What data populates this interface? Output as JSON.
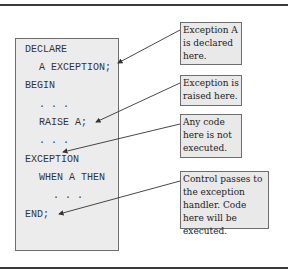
{
  "code_block": {
    "lines": [
      {
        "text": "DECLARE",
        "indent": 0
      },
      {
        "text": "A EXCEPTION;",
        "indent": 1
      },
      {
        "text": "BEGIN",
        "indent": 0
      },
      {
        "text": ". . .",
        "indent": 1
      },
      {
        "text": "RAISE A;",
        "indent": 1
      },
      {
        "text": ". . .",
        "indent": 1
      },
      {
        "text": "EXCEPTION",
        "indent": 0
      },
      {
        "text": "WHEN A THEN",
        "indent": 1
      },
      {
        "text": ". . .",
        "indent": 2
      },
      {
        "text": "END;",
        "indent": 0
      }
    ]
  },
  "callouts": [
    {
      "text": "Exception A is declared here.",
      "target_line": "A EXCEPTION;"
    },
    {
      "text": "Exception is raised here.",
      "target_line": "RAISE A;"
    },
    {
      "text": "Any code here is not executed.",
      "target_line": ". . ."
    },
    {
      "text": "Control passes to the exception handler.  Code here will be executed.",
      "target_line": "END;"
    }
  ],
  "colors": {
    "box_fill": "#ececec",
    "callout_fill": "#e9e9e9",
    "border": "#6e6e6e",
    "arrow": "#333333"
  }
}
